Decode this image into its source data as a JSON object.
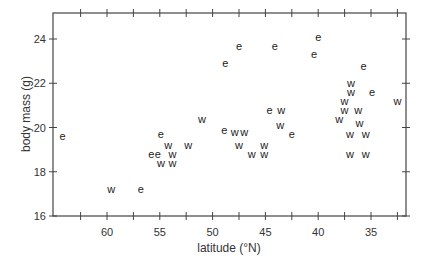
{
  "chart_data": {
    "type": "scatter",
    "title": "",
    "xlabel": "latitude (°N)",
    "ylabel": "body mass (g)",
    "xlim": [
      65,
      31.4
    ],
    "ylim": [
      16,
      25.2
    ],
    "x_inverted": true,
    "xticks": [
      60,
      55,
      50,
      45,
      40,
      35
    ],
    "xticks_minor": [
      62.5,
      57.5,
      52.5,
      47.5,
      42.5,
      37.5,
      32.5
    ],
    "yticks": [
      16,
      18,
      20,
      22,
      24
    ],
    "grid": false,
    "legend": "none (markers are letters: e, w)",
    "series": [
      {
        "name": "e",
        "marker": "e",
        "points": [
          [
            64.2,
            19.6
          ],
          [
            56.8,
            17.2
          ],
          [
            54.9,
            19.7
          ],
          [
            55.8,
            18.8
          ],
          [
            55.2,
            18.8
          ],
          [
            48.8,
            22.9
          ],
          [
            47.5,
            23.7
          ],
          [
            44.1,
            23.7
          ],
          [
            40.0,
            24.1
          ],
          [
            40.4,
            23.3
          ],
          [
            48.9,
            19.9
          ],
          [
            44.6,
            20.8
          ],
          [
            42.5,
            19.7
          ],
          [
            35.7,
            22.8
          ],
          [
            34.9,
            21.6
          ]
        ]
      },
      {
        "name": "w",
        "marker": "w",
        "points": [
          [
            59.6,
            17.2
          ],
          [
            54.2,
            19.2
          ],
          [
            52.3,
            19.2
          ],
          [
            53.8,
            18.8
          ],
          [
            54.9,
            18.4
          ],
          [
            53.8,
            18.4
          ],
          [
            51.0,
            20.4
          ],
          [
            47.9,
            19.8
          ],
          [
            47.0,
            19.8
          ],
          [
            47.5,
            19.2
          ],
          [
            46.3,
            18.8
          ],
          [
            45.1,
            19.2
          ],
          [
            45.1,
            18.8
          ],
          [
            43.5,
            20.8
          ],
          [
            43.6,
            20.1
          ],
          [
            36.9,
            22.0
          ],
          [
            36.9,
            21.6
          ],
          [
            37.5,
            21.2
          ],
          [
            37.5,
            20.8
          ],
          [
            36.2,
            20.8
          ],
          [
            38.0,
            20.4
          ],
          [
            36.1,
            20.2
          ],
          [
            37.0,
            19.7
          ],
          [
            35.5,
            19.7
          ],
          [
            37.0,
            18.8
          ],
          [
            35.5,
            18.8
          ],
          [
            32.5,
            21.2
          ]
        ]
      }
    ]
  }
}
